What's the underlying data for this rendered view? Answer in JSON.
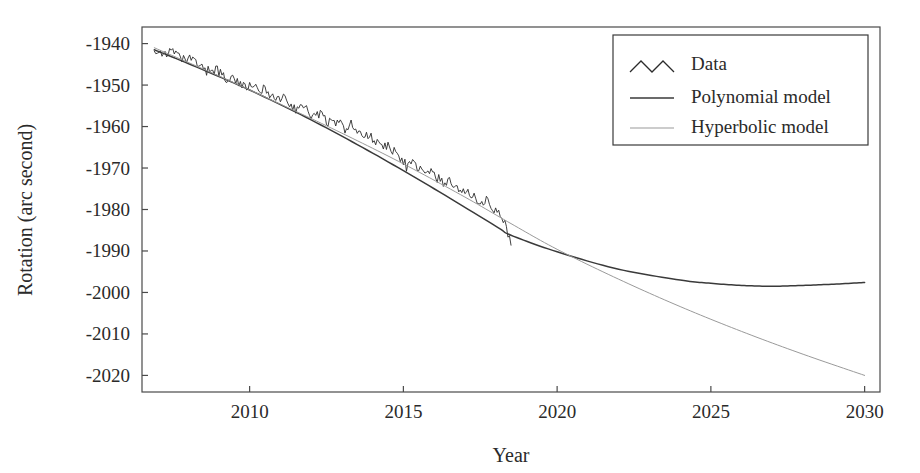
{
  "chart_data": {
    "type": "line",
    "title": "",
    "xlabel": "Year",
    "ylabel": "Rotation (arc second)",
    "xlim": [
      2006.5,
      2030.5
    ],
    "ylim": [
      -2024,
      -1936
    ],
    "xticks": [
      "2010",
      "2015",
      "2020",
      "2025",
      "2030"
    ],
    "xtick_values": [
      2010,
      2015,
      2020,
      2025,
      2030
    ],
    "yticks": [
      "-1940",
      "-1950",
      "-1960",
      "-1970",
      "-1980",
      "-1990",
      "-2000",
      "-2010",
      "-2020"
    ],
    "ytick_values": [
      -1940,
      -1950,
      -1960,
      -1970,
      -1980,
      -1990,
      -2000,
      -2010,
      -2020
    ],
    "grid": false,
    "legend_position": "top-right",
    "series": [
      {
        "name": "Data",
        "style": "noisy-line",
        "color": "#2b2b2b",
        "x": [
          2006.9,
          2007.1,
          2007.3,
          2007.5,
          2007.7,
          2007.9,
          2008.1,
          2008.3,
          2008.5,
          2008.7,
          2008.9,
          2009.1,
          2009.3,
          2009.5,
          2009.7,
          2009.9,
          2010.1,
          2010.3,
          2010.5,
          2010.7,
          2010.9,
          2011.1,
          2011.3,
          2011.5,
          2011.7,
          2011.9,
          2012.1,
          2012.3,
          2012.5,
          2012.7,
          2012.9,
          2013.1,
          2013.3,
          2013.5,
          2013.7,
          2013.9,
          2014.1,
          2014.3,
          2014.5,
          2014.7,
          2014.9,
          2015.1,
          2015.3,
          2015.5,
          2015.7,
          2015.9,
          2016.1,
          2016.3,
          2016.5,
          2016.7,
          2016.9,
          2017.1,
          2017.3,
          2017.5,
          2017.7,
          2017.9,
          2018.1,
          2018.3,
          2018.5
        ],
        "y": [
          -1941.2,
          -1941.8,
          -1942.6,
          -1942.0,
          -1943.4,
          -1944.2,
          -1943.6,
          -1945.0,
          -1946.2,
          -1946.8,
          -1946.0,
          -1947.6,
          -1948.8,
          -1948.2,
          -1949.6,
          -1950.8,
          -1950.2,
          -1951.6,
          -1950.8,
          -1952.4,
          -1953.6,
          -1953.0,
          -1954.6,
          -1955.8,
          -1954.8,
          -1956.4,
          -1957.6,
          -1956.8,
          -1958.4,
          -1959.6,
          -1959.0,
          -1960.4,
          -1959.6,
          -1961.2,
          -1962.6,
          -1962.0,
          -1963.4,
          -1965.2,
          -1964.4,
          -1966.0,
          -1967.4,
          -1969.6,
          -1968.8,
          -1970.2,
          -1971.6,
          -1971.0,
          -1972.4,
          -1973.6,
          -1973.0,
          -1974.8,
          -1976.2,
          -1975.6,
          -1977.0,
          -1978.4,
          -1977.8,
          -1979.4,
          -1980.8,
          -1983.2,
          -1988.6
        ]
      },
      {
        "name": "Polynomial model",
        "style": "solid",
        "color": "#3a3a3a",
        "x": [
          2006.9,
          2008,
          2010,
          2012,
          2014,
          2016,
          2018,
          2018.5,
          2020,
          2022,
          2024,
          2025,
          2026,
          2027,
          2028,
          2029,
          2030
        ],
        "y": [
          -1941.5,
          -1944.8,
          -1951.2,
          -1958.4,
          -1966.4,
          -1975.0,
          -1984.0,
          -1986.2,
          -1990.2,
          -1994.4,
          -1997.0,
          -1997.8,
          -1998.3,
          -1998.5,
          -1998.3,
          -1998.0,
          -1997.6
        ]
      },
      {
        "name": "Hyperbolic model",
        "style": "light-solid",
        "color": "#9a9a9a",
        "x": [
          2006.9,
          2009,
          2011,
          2013,
          2015,
          2017,
          2018.5,
          2020,
          2022,
          2024,
          2026,
          2028,
          2030
        ],
        "y": [
          -1941.0,
          -1947.8,
          -1954.6,
          -1961.6,
          -1969.0,
          -1977.0,
          -1983.4,
          -1989.6,
          -1996.8,
          -2003.4,
          -2009.4,
          -2014.9,
          -2020.0
        ]
      }
    ]
  },
  "legend": {
    "items": [
      {
        "label": "Data",
        "marker": "zigzag"
      },
      {
        "label": "Polynomial model",
        "marker": "line-dark"
      },
      {
        "label": "Hyperbolic model",
        "marker": "line-light"
      }
    ]
  },
  "axes": {
    "x_title": "Year",
    "y_title": "Rotation (arc second)"
  }
}
